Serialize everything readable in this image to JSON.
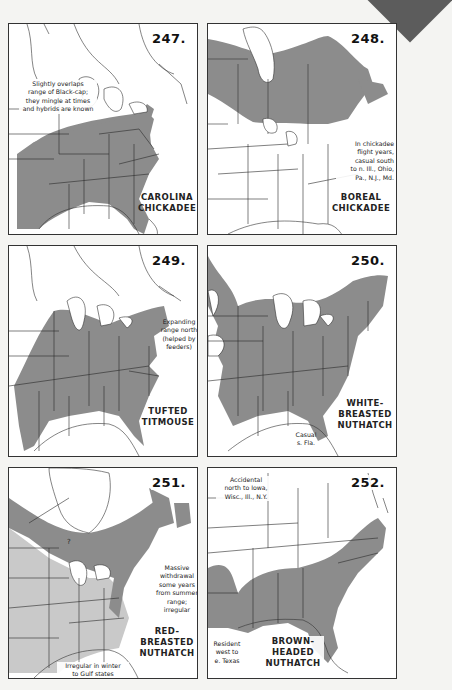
{
  "page": {
    "background": "#f4f4f2",
    "range_fill_dark": "#8c8c8c",
    "range_fill_light": "#c9c9c9"
  },
  "maps": [
    {
      "number": "247.",
      "title_line1": "CAROLINA",
      "title_line2": "CHICKADEE",
      "notes": [
        {
          "lines": [
            "Slightly overlaps",
            "range of Black-cap;",
            "they mingle at times",
            "and hybrids are known"
          ]
        }
      ]
    },
    {
      "number": "248.",
      "title_line1": "BOREAL",
      "title_line2": "CHICKADEE",
      "notes": [
        {
          "lines": [
            "In chickadee",
            "flight years,",
            "casual south",
            "to n. Ill., Ohio,",
            "Pa., N.J., Md."
          ]
        }
      ]
    },
    {
      "number": "249.",
      "title_line1": "TUFTED",
      "title_line2": "TITMOUSE",
      "notes": [
        {
          "lines": [
            "Expanding",
            "range north",
            "(helped by",
            "feeders)"
          ]
        }
      ]
    },
    {
      "number": "250.",
      "title_line1": "WHITE-",
      "title_line2": "BREASTED",
      "title_line3": "NUTHATCH",
      "notes": [
        {
          "lines": [
            "Casual",
            "s. Fla."
          ]
        }
      ]
    },
    {
      "number": "251.",
      "title_line1": "RED-",
      "title_line2": "BREASTED",
      "title_line3": "NUTHATCH",
      "question_mark": "?",
      "notes": [
        {
          "lines": [
            "Massive",
            "withdrawal",
            "some years",
            "from summer",
            "range;",
            "irregular"
          ]
        },
        {
          "lines": [
            "Irregular in winter",
            "to Gulf states"
          ]
        }
      ]
    },
    {
      "number": "252.",
      "title_line1": "BROWN-",
      "title_line2": "HEADED",
      "title_line3": "NUTHATCH",
      "notes": [
        {
          "lines": [
            "Accidental",
            "north to Iowa,",
            "Wisc., Ill., N.Y."
          ]
        },
        {
          "lines": [
            "Resident",
            "west to",
            "e. Texas"
          ]
        }
      ]
    }
  ]
}
